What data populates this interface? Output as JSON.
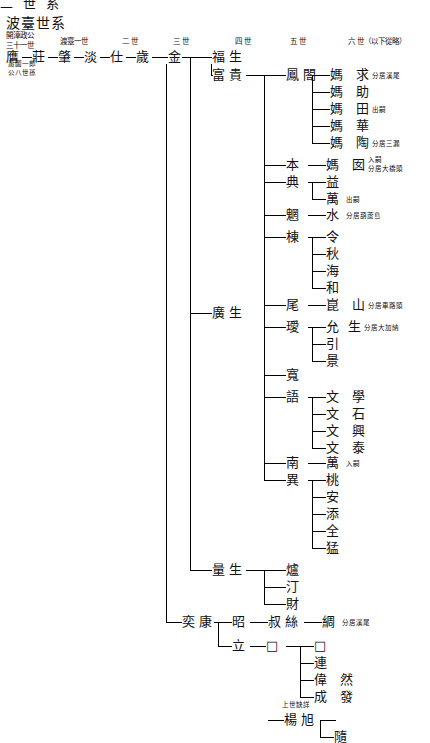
{
  "page": {
    "clipped_header": "二 世 系",
    "title": "波臺世系",
    "columns": [
      {
        "label": "開漳政公",
        "sub": "三十一世"
      },
      {
        "label": "渡臺一世",
        "sub": ""
      },
      {
        "label": "二 世",
        "sub": ""
      },
      {
        "label": "三 世",
        "sub": ""
      },
      {
        "label": "四 世",
        "sub": ""
      },
      {
        "label": "五 世",
        "sub": ""
      },
      {
        "label": "六 世（以下從略）",
        "sub": ""
      }
    ],
    "root_note": [
      "蕭圖一郎",
      "公八世孫"
    ],
    "gen1": [
      "膺",
      "莊",
      "肇",
      "淡",
      "仕",
      "歲"
    ],
    "nodes": [
      {
        "name": "金",
        "note": ""
      },
      {
        "name": "福 生",
        "note": ""
      },
      {
        "name": "富 貴",
        "note": ""
      },
      {
        "name": "鳳 閤",
        "note": ""
      },
      {
        "name": "媽",
        "note": "求 分居溪尾"
      },
      {
        "name": "媽",
        "note": "助"
      },
      {
        "name": "媽",
        "note": "田 出嗣"
      },
      {
        "name": "媽",
        "note": "華"
      },
      {
        "name": "媽",
        "note": "陶 分居三漏"
      },
      {
        "name": "本",
        "note": ""
      },
      {
        "name": "媽",
        "note": "囡 入嗣\n分居大橋頭"
      },
      {
        "name": "典",
        "note": ""
      },
      {
        "name": "益",
        "note": ""
      },
      {
        "name": "萬",
        "note": "出嗣"
      },
      {
        "name": "魍",
        "note": ""
      },
      {
        "name": "水",
        "note": "分居葫蘆島"
      },
      {
        "name": "棟",
        "note": ""
      },
      {
        "name": "令",
        "note": ""
      },
      {
        "name": "秋",
        "note": ""
      },
      {
        "name": "海",
        "note": ""
      },
      {
        "name": "和",
        "note": ""
      },
      {
        "name": "廣 生",
        "note": ""
      },
      {
        "name": "尾",
        "note": ""
      },
      {
        "name": "崑",
        "note": "山 分居車路頭"
      },
      {
        "name": "璦",
        "note": ""
      },
      {
        "name": "允",
        "note": "生 分居大加納"
      },
      {
        "name": "引",
        "note": ""
      },
      {
        "name": "景",
        "note": ""
      },
      {
        "name": "寬",
        "note": ""
      },
      {
        "name": "語",
        "note": ""
      },
      {
        "name": "文",
        "note": "學"
      },
      {
        "name": "文",
        "note": "石"
      },
      {
        "name": "文",
        "note": "興"
      },
      {
        "name": "文",
        "note": "泰"
      },
      {
        "name": "南",
        "note": ""
      },
      {
        "name": "萬",
        "note": "入嗣"
      },
      {
        "name": "異",
        "note": ""
      },
      {
        "name": "桃",
        "note": ""
      },
      {
        "name": "安",
        "note": ""
      },
      {
        "name": "添",
        "note": ""
      },
      {
        "name": "全",
        "note": ""
      },
      {
        "name": "猛",
        "note": ""
      },
      {
        "name": "量 生",
        "note": ""
      },
      {
        "name": "爐",
        "note": ""
      },
      {
        "name": "汀",
        "note": ""
      },
      {
        "name": "財",
        "note": ""
      },
      {
        "name": "奕 康",
        "note": ""
      },
      {
        "name": "昭",
        "note": ""
      },
      {
        "name": "叔 絲",
        "note": ""
      },
      {
        "name": "綢",
        "note": "分居溪尾"
      },
      {
        "name": "立",
        "note": ""
      },
      {
        "name": "□",
        "note": ""
      },
      {
        "name": "□",
        "note": ""
      },
      {
        "name": "連",
        "note": ""
      },
      {
        "name": "偉",
        "note": "然"
      },
      {
        "name": "成",
        "note": "發"
      }
    ],
    "footer": {
      "note": "上世缺詳",
      "names": [
        "楊 旭"
      ],
      "last": "隨"
    }
  }
}
